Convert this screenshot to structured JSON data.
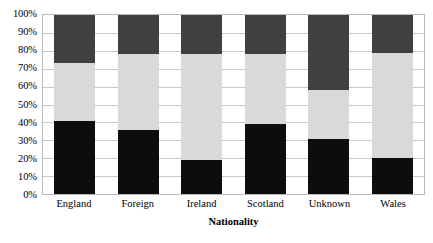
{
  "chart_data": {
    "type": "bar",
    "subtype": "stacked-percent",
    "title": "",
    "xlabel": "Nationality",
    "ylabel": "",
    "ylim": [
      0,
      100
    ],
    "grid": true,
    "legend": "none",
    "categories": [
      "England",
      "Foreign",
      "Ireland",
      "Scotland",
      "Unknown",
      "Wales"
    ],
    "ytick_labels": [
      "0%",
      "10%",
      "20%",
      "30%",
      "40%",
      "50%",
      "60%",
      "70%",
      "80%",
      "90%",
      "100%"
    ],
    "ytick_values": [
      0,
      10,
      20,
      30,
      40,
      50,
      60,
      70,
      80,
      90,
      100
    ],
    "series": [
      {
        "name": "bottom",
        "color": "#0d0d0d",
        "values": [
          41,
          36,
          19,
          39,
          31,
          20
        ]
      },
      {
        "name": "middle",
        "color": "#d9d9d9",
        "values": [
          32,
          42,
          59,
          39,
          27,
          59
        ]
      },
      {
        "name": "top",
        "color": "#404040",
        "values": [
          27,
          22,
          22,
          22,
          42,
          21
        ]
      }
    ]
  },
  "style": {
    "plot_border_color": "#b7b7b7",
    "gridline_color": "#c9c9c9",
    "background": "#ffffff"
  }
}
